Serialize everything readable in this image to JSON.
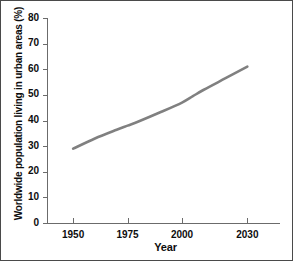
{
  "chart_data": {
    "type": "line",
    "title": "",
    "xlabel": "Year",
    "ylabel": "Worldwide population living in urban areas (%)",
    "xlim": [
      1938,
      2045
    ],
    "ylim": [
      0,
      80
    ],
    "xticks": [
      1950,
      1975,
      2000,
      2030
    ],
    "xtick_labels": [
      "1950",
      "1975",
      "2000",
      "2030"
    ],
    "yticks": [
      0,
      10,
      20,
      30,
      40,
      50,
      60,
      70,
      80
    ],
    "ytick_labels": [
      "0",
      "10",
      "20",
      "30",
      "40",
      "50",
      "60",
      "70",
      "80"
    ],
    "grid": false,
    "legend": null,
    "line_color": "#808080",
    "axis_color": "#6b6b6b",
    "text_color": "#0d0d0d",
    "series": [
      {
        "name": "Worldwide urban population share",
        "x": [
          1950,
          1960,
          1970,
          1975,
          1980,
          1990,
          2000,
          2005,
          2010,
          2020,
          2030
        ],
        "y": [
          29.0,
          33.0,
          36.4,
          38.0,
          39.6,
          43.2,
          47.0,
          49.5,
          52.0,
          56.5,
          61.0
        ]
      }
    ]
  }
}
